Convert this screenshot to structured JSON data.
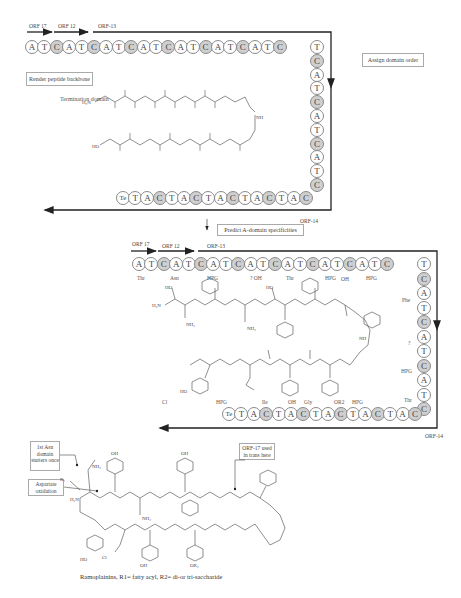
{
  "panel1": {
    "orfs": [
      "ORF 17",
      "ORF 12",
      "ORF-13"
    ],
    "top_row": [
      "A",
      "T",
      "C",
      "A",
      "T",
      "C",
      "A",
      "T",
      "C",
      "A",
      "T",
      "C",
      "A",
      "T",
      "C",
      "A",
      "T",
      "C",
      "A",
      "T",
      "C"
    ],
    "right_column": [
      "T",
      "C",
      "A",
      "T",
      "C",
      "A",
      "T",
      "C",
      "A",
      "T",
      "C"
    ],
    "bottom_row": [
      "Te",
      "T",
      "A",
      "C",
      "T",
      "A",
      "C",
      "T",
      "A",
      "C",
      "T",
      "A",
      "C",
      "T",
      "A",
      "C"
    ],
    "render_label": "Render peptide backbone",
    "termination_label": "Termination domain",
    "orf_end": "ORF-14",
    "assign_label": "Assign domain order"
  },
  "step_arrow_label": "Predict A-domain specificities",
  "panel2": {
    "orfs": [
      "ORF 17",
      "ORF 12",
      "ORF-13"
    ],
    "top_row": [
      "A",
      "T",
      "C",
      "A",
      "T",
      "C",
      "A",
      "T",
      "C",
      "A",
      "T",
      "C",
      "A",
      "T",
      "C",
      "A",
      "T",
      "C",
      "A",
      "T",
      "C"
    ],
    "top_labels": [
      "Thr",
      "Asn",
      "HPG",
      "? OH",
      "Thr",
      "HPG",
      "OH",
      "HPG"
    ],
    "right_column": [
      "T",
      "C",
      "A",
      "T",
      "C",
      "A",
      "T",
      "C",
      "A",
      "T",
      "C"
    ],
    "right_labels": [
      "Phe",
      "?",
      "HPG",
      "Thr"
    ],
    "bottom_row": [
      "Te",
      "T",
      "A",
      "C",
      "T",
      "A",
      "C",
      "T",
      "A",
      "C",
      "T",
      "A",
      "C",
      "T",
      "A",
      "C"
    ],
    "bottom_labels": [
      "Cl",
      "HPG",
      "Ile",
      "OH",
      "Gly",
      "OR2",
      "HPG"
    ],
    "orf_end": "ORF-14"
  },
  "panel3": {
    "callouts": [
      "1st Asn domain stutters once",
      "Aspartate oxidation",
      "ORF-17 used in trans here"
    ],
    "caption": "Ramoplainins, R1= fatty acyl, R2= di-or tri-saccharide"
  }
}
